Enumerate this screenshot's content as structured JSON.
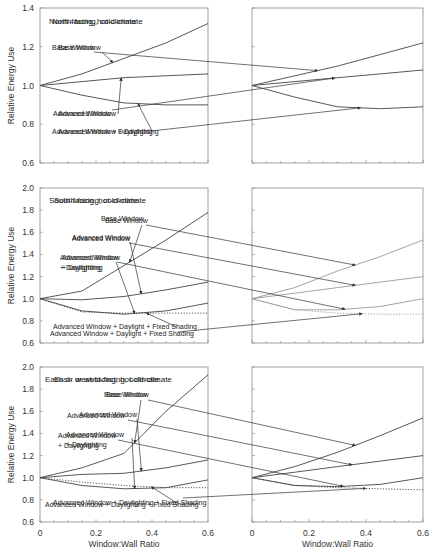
{
  "chart_data": [
    {
      "type": "line",
      "title": "North-facing, cold-climate",
      "xlabel": "",
      "ylabel": "Relative Energy Use",
      "xlim": [
        0,
        0.6
      ],
      "ylim": [
        0.6,
        1.4
      ],
      "yticks": [
        "0.6",
        "0.8",
        "1.0",
        "1.2",
        "1.4"
      ],
      "x": [
        0,
        0.15,
        0.3,
        0.45,
        0.6
      ],
      "series": [
        {
          "name": "Base Window",
          "values": [
            1.0,
            1.06,
            1.14,
            1.22,
            1.32
          ],
          "style": "solid"
        },
        {
          "name": "Advanced Window",
          "values": [
            1.0,
            1.02,
            1.04,
            1.05,
            1.06
          ],
          "style": "solid"
        },
        {
          "name": "Advanced Window + Daylighting",
          "values": [
            1.0,
            0.95,
            0.91,
            0.9,
            0.9
          ],
          "style": "solid"
        }
      ]
    },
    {
      "type": "line",
      "title": "North-facing, hot-climate",
      "xlabel": "",
      "ylabel": "",
      "xlim": [
        0,
        0.6
      ],
      "ylim": [
        0.6,
        1.4
      ],
      "x": [
        0,
        0.15,
        0.3,
        0.45,
        0.6
      ],
      "series": [
        {
          "name": "Base Window",
          "values": [
            1.0,
            1.05,
            1.1,
            1.16,
            1.22
          ],
          "style": "solid"
        },
        {
          "name": "Advanced Window",
          "values": [
            1.0,
            1.02,
            1.04,
            1.06,
            1.08
          ],
          "style": "solid"
        },
        {
          "name": "Advanced Window + Daylighting",
          "values": [
            1.0,
            0.94,
            0.89,
            0.88,
            0.89
          ],
          "style": "solid"
        }
      ]
    },
    {
      "type": "line",
      "title": "South-facing, cold-climate",
      "xlabel": "",
      "ylabel": "Relative Energy Use",
      "xlim": [
        0,
        0.6
      ],
      "ylim": [
        0.6,
        2.0
      ],
      "yticks": [
        "0.6",
        "0.8",
        "1.0",
        "1.2",
        "1.4",
        "1.6",
        "1.8",
        "2.0"
      ],
      "x": [
        0,
        0.15,
        0.3,
        0.45,
        0.6
      ],
      "series": [
        {
          "name": "Base Window",
          "values": [
            1.0,
            1.07,
            1.3,
            1.53,
            1.78
          ],
          "style": "solid"
        },
        {
          "name": "Advanced Window",
          "values": [
            1.0,
            0.99,
            1.02,
            1.08,
            1.15
          ],
          "style": "solid"
        },
        {
          "name": "Advanced Window + Daylighting",
          "values": [
            1.0,
            0.89,
            0.86,
            0.89,
            0.96
          ],
          "style": "solid"
        },
        {
          "name": "Advanced Window + Daylight + Fixed Shading",
          "values": [
            1.0,
            0.88,
            0.87,
            0.87,
            0.87
          ],
          "style": "dotted"
        }
      ]
    },
    {
      "type": "line",
      "title": "South-facing, hot-climate",
      "xlabel": "",
      "ylabel": "",
      "xlim": [
        0,
        0.6
      ],
      "ylim": [
        0.6,
        2.0
      ],
      "x": [
        0,
        0.15,
        0.3,
        0.45,
        0.6
      ],
      "series": [
        {
          "name": "Base Window",
          "values": [
            1.0,
            1.1,
            1.25,
            1.38,
            1.53
          ],
          "style": "solid"
        },
        {
          "name": "Advanced Window",
          "values": [
            1.0,
            1.05,
            1.1,
            1.15,
            1.2
          ],
          "style": "solid"
        },
        {
          "name": "Advanced Window + Daylighting",
          "values": [
            1.0,
            0.9,
            0.9,
            0.93,
            1.0
          ],
          "style": "solid"
        },
        {
          "name": "Advanced Window + Daylight + Fixed Shading",
          "values": [
            1.0,
            0.9,
            0.87,
            0.86,
            0.86
          ],
          "style": "dotted"
        }
      ]
    },
    {
      "type": "line",
      "title": "East- or west-facing, cold-climate",
      "xlabel": "Window:Wall Ratio",
      "ylabel": "Relative Energy Use",
      "xlim": [
        0,
        0.6
      ],
      "ylim": [
        0.6,
        2.0
      ],
      "xticks": [
        "0",
        "0.2",
        "0.4",
        "0.6"
      ],
      "yticks": [
        "0.6",
        "0.8",
        "1.0",
        "1.2",
        "1.4",
        "1.6",
        "1.8",
        "2.0"
      ],
      "x": [
        0,
        0.15,
        0.3,
        0.45,
        0.6
      ],
      "series": [
        {
          "name": "Base Window",
          "values": [
            1.0,
            1.09,
            1.22,
            1.6,
            1.93
          ],
          "style": "solid"
        },
        {
          "name": "Advanced Window",
          "values": [
            1.0,
            1.03,
            1.04,
            1.09,
            1.16
          ],
          "style": "solid"
        },
        {
          "name": "Advanced Window + Daylighting",
          "values": [
            1.0,
            0.93,
            0.9,
            0.91,
            0.98
          ],
          "style": "solid"
        },
        {
          "name": "Advanced Window + Daylighting + Fixed Shading",
          "values": [
            1.0,
            0.96,
            0.93,
            0.91,
            0.91
          ],
          "style": "dotted"
        }
      ]
    },
    {
      "type": "line",
      "title": "East- or west-facing, hot-climate",
      "xlabel": "Window:Wall Ratio",
      "ylabel": "",
      "xlim": [
        0,
        0.6
      ],
      "ylim": [
        0.6,
        2.0
      ],
      "xticks": [
        "0",
        "0.2",
        "0.4",
        "0.6"
      ],
      "x": [
        0,
        0.15,
        0.3,
        0.45,
        0.6
      ],
      "series": [
        {
          "name": "Base Window",
          "values": [
            1.0,
            1.1,
            1.23,
            1.38,
            1.54
          ],
          "style": "solid"
        },
        {
          "name": "Advanced Window",
          "values": [
            1.0,
            1.05,
            1.1,
            1.15,
            1.2
          ],
          "style": "solid"
        },
        {
          "name": "Advanced Window + Daylighting",
          "values": [
            1.0,
            0.93,
            0.92,
            0.94,
            1.0
          ],
          "style": "solid"
        },
        {
          "name": "Advanced Window + Daylighting + Fixed Shading",
          "values": [
            1.0,
            0.93,
            0.91,
            0.9,
            0.89
          ],
          "style": "dotted"
        }
      ]
    }
  ],
  "panels": {
    "p0": {
      "title": "North-facing, cold-climate",
      "l1": "Base Window",
      "l2": "Advanced Window",
      "l3": "Advanced Window + Daylighting",
      "ylabel": "Relative Energy Use"
    },
    "p1": {
      "title": "North-facing, hot-climate",
      "l1": "Base Window",
      "l2": "Advanced Window",
      "l3": "Advanced Window + Daylighting"
    },
    "p2": {
      "title": "South-facing, cold-climate",
      "l1": "Base Window",
      "l2": "Advanced Window",
      "l3a": "Advanced Window",
      "l3b": "+ Daylighting",
      "l4": "Advanced Window + Daylight + Fixed Shading",
      "ylabel": "Relative Energy Use"
    },
    "p3": {
      "title": "South-facing, hot-climate",
      "l1": "Base Window",
      "l2": "Advanced Window",
      "l3a": "Advanced Window",
      "l3b": "+ Daylighting",
      "l4": "Advanced Window + Daylight + Fixed Shading"
    },
    "p4": {
      "title": "East- or west-facing, cold-climate",
      "l1": "Base Window",
      "l2": "Advanced Window",
      "l3a": "Advanced Window",
      "l3b": "+ Daylighting",
      "l4": "Advanced Window + Daylighting + Fixed Shading",
      "ylabel": "Relative Energy Use",
      "xlabel": "Window:Wall Ratio"
    },
    "p5": {
      "title": "East- or west-facing, hot-climate",
      "l1": "Base Window",
      "l2": "Advanced Window",
      "l3a": "Advanced Window",
      "l3b": "+ Daylighting",
      "l4": "Advanced Window + Daylighting + Fixed Shading",
      "xlabel": "Window:Wall Ratio"
    }
  },
  "ticks": {
    "y_top": [
      "1.4",
      "1.2",
      "1.0",
      "0.8",
      "0.6"
    ],
    "y_mid": [
      "2.0",
      "1.8",
      "1.6",
      "1.4",
      "1.2",
      "1.0",
      "0.8",
      "0.6"
    ],
    "x": [
      "0",
      "0.2",
      "0.4",
      "0.6"
    ]
  }
}
